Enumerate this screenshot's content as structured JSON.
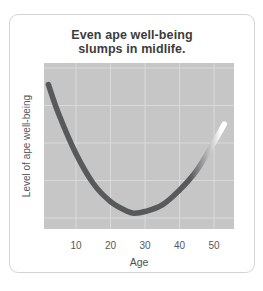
{
  "chart_data": {
    "type": "line",
    "title": "Even ape well-being slumps in midlife.",
    "title_lines": [
      "Even ape well-being",
      "slumps in midlife."
    ],
    "xlabel": "Age",
    "ylabel": "Level of ape well-being",
    "x_ticks": [
      10,
      20,
      30,
      40,
      50
    ],
    "x_range": [
      2,
      56
    ],
    "y_range": [
      0,
      100
    ],
    "y_ticks": "none (y axis unlabeled)",
    "grid": "on (light gridlines on gray panel, vertical lines at each age tick, 5 horizontal lines)",
    "legend": "none",
    "series": [
      {
        "name": "ape-well-being-curve",
        "x": [
          2,
          5,
          10,
          15,
          20,
          25,
          27,
          30,
          35,
          40,
          45,
          50,
          53
        ],
        "y": [
          87,
          69,
          45,
          27,
          16,
          10,
          9,
          10,
          14,
          23,
          35,
          52,
          63
        ]
      }
    ],
    "shape_note": "U-shaped curve, minimum near age 27; thick rounded stroke fades from dark gray to white at the oldest-age (right) tip"
  },
  "colors": {
    "page_bg": "#ffffff",
    "card_border": "#d4d4d4",
    "title_text": "#3c3c3c",
    "axis_text": "#55575a",
    "plot_bg": "#c5c6c5",
    "grid": "#d9dad9",
    "line": "#58595b",
    "line_fade_mid": "#8a8b8c",
    "line_tip": "#ffffff"
  }
}
